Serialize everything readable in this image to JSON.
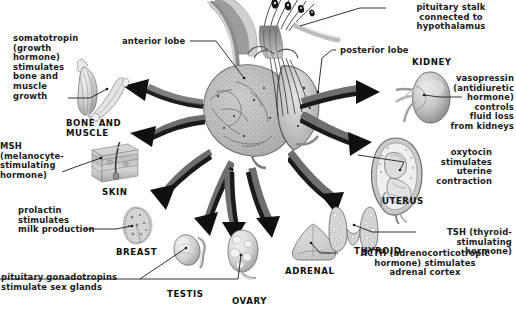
{
  "figure": {
    "background_color": "#ffffff",
    "ink_color": "#1b1b1b",
    "style": "grayscale medical illustration"
  },
  "gland_labels": [
    {
      "key": "anterior_lobe",
      "text": "anterior lobe",
      "align": "left"
    },
    {
      "key": "posterior_lobe",
      "text": "posterior lobe",
      "align": "left"
    },
    {
      "key": "pituitary_stalk",
      "text": "pituitary stalk\nconnected to\nhypothalamus",
      "align": "center"
    }
  ],
  "hormone_labels": [
    {
      "key": "somatotropin",
      "text": "somatotropin\n(growth\nhormone)\nstimulates\nbone and\nmuscle\ngrowth",
      "align": "left"
    },
    {
      "key": "msh",
      "text": "MSH\n(melanocyte-\nstimulating\nhormone)",
      "align": "left"
    },
    {
      "key": "prolactin",
      "text": "prolactin\nstimulates\nmilk production",
      "align": "left"
    },
    {
      "key": "gonadotropins",
      "text": "pituitary gonadotropins\nstimulate sex glands",
      "align": "left"
    },
    {
      "key": "vasopressin",
      "text": "vasopressin\n(antidiuretic\nhormone)\ncontrols\nfluid loss\nfrom kidneys",
      "align": "right"
    },
    {
      "key": "oxytocin",
      "text": "oxytocin\nstimulates\nuterine\ncontraction",
      "align": "right"
    },
    {
      "key": "tsh",
      "text": "TSH (thyroid-\nstimulating\nhormone)",
      "align": "right"
    },
    {
      "key": "acth",
      "text": "ACTH (adrenocorticotropic\nhormone) stimulates\nadrenal cortex",
      "align": "center"
    }
  ],
  "organ_labels": [
    {
      "key": "bone_and_muscle",
      "text": "BONE AND\nMUSCLE"
    },
    {
      "key": "skin",
      "text": "SKIN"
    },
    {
      "key": "breast",
      "text": "BREAST"
    },
    {
      "key": "testis",
      "text": "TESTIS"
    },
    {
      "key": "ovary",
      "text": "OVARY"
    },
    {
      "key": "adrenal",
      "text": "ADRENAL"
    },
    {
      "key": "thyroid",
      "text": "THYROID"
    },
    {
      "key": "uterus",
      "text": "UTERUS"
    },
    {
      "key": "kidney",
      "text": "KIDNEY"
    }
  ]
}
